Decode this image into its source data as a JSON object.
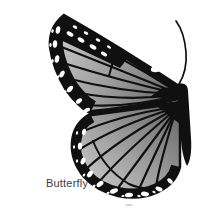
{
  "image": {
    "label": "Butterfly",
    "subject": "Grayscale illustration of the left half of a monarch-style butterfly with one antenna and spotted black wing margins"
  },
  "colors": {
    "background": "#ffffff",
    "ink": "#101010",
    "label_text": "#3d3d3d",
    "wing_light": "#c9c9c9",
    "wing_mid": "#9a9a9a",
    "wing_dark": "#686868",
    "spot_white": "#ffffff",
    "smudge": "#d6d6d6"
  }
}
